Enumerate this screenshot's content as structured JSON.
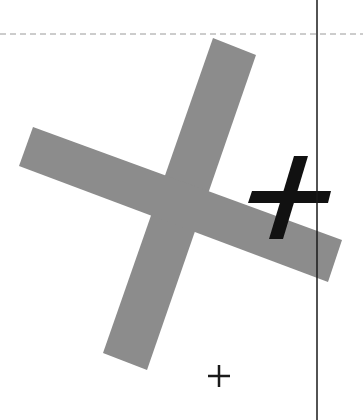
{
  "canvas": {
    "width": 363,
    "height": 420,
    "background": "#ffffff"
  },
  "dashed_line": {
    "y": 34,
    "color": "#9a9a9a"
  },
  "vertical_line": {
    "x": 317,
    "color": "#1a1a1a"
  },
  "gray_cross": {
    "color": "#8c8c8c",
    "bar_a_points": "213,38 256,55 147,370 103,353",
    "bar_b_points": "33,127 342,240 328,282 19,166"
  },
  "black_cross": {
    "color": "#111111",
    "stroke_points": "294,156 308,156 283,239 269,239",
    "bar_points": "252,191 331,191 328,203 248,203"
  },
  "small_plus": {
    "x": 219,
    "y": 376,
    "size": 22,
    "color": "#1a1a1a"
  }
}
